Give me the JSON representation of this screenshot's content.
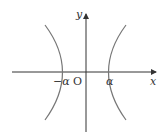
{
  "diagram": {
    "type": "hyperbola",
    "axes": {
      "x_label": "x",
      "y_label": "y",
      "origin_label": "O"
    },
    "vertices": {
      "left_label": "−α",
      "right_label": "α"
    },
    "colors": {
      "curve": "#777777",
      "axis": "#333333"
    }
  }
}
